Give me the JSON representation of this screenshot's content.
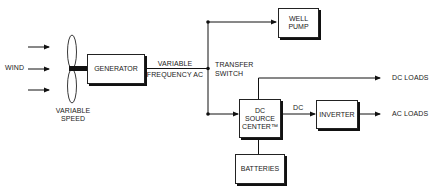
{
  "diagram": {
    "type": "block-diagram",
    "inputs": {
      "wind_label": "WIND",
      "rotor_label_line1": "VARIABLE",
      "rotor_label_line2": "SPEED"
    },
    "blocks": {
      "generator": "GENERATOR",
      "well_pump_line1": "WELL",
      "well_pump_line2": "PUMP",
      "dc_source_line1": "DC",
      "dc_source_line2": "SOURCE",
      "dc_source_line3": "CENTER™",
      "inverter": "INVERTER",
      "batteries": "BATTERIES"
    },
    "connections": {
      "gen_out_line1": "VARIABLE",
      "gen_out_line2": "FREQUENCY AC",
      "switch_line1": "TRANSFER",
      "switch_line2": "SWITCH",
      "dc_link": "DC"
    },
    "outputs": {
      "dc_loads": "DC LOADS",
      "ac_loads": "AC LOADS"
    },
    "edges": [
      {
        "from": "wind",
        "to": "rotor"
      },
      {
        "from": "rotor",
        "to": "generator"
      },
      {
        "from": "generator",
        "to": "transfer_switch",
        "label": "VARIABLE FREQUENCY AC"
      },
      {
        "from": "transfer_switch",
        "to": "well_pump"
      },
      {
        "from": "transfer_switch",
        "to": "dc_source_center"
      },
      {
        "from": "dc_source_center",
        "to": "dc_loads"
      },
      {
        "from": "dc_source_center",
        "to": "inverter",
        "label": "DC"
      },
      {
        "from": "inverter",
        "to": "ac_loads"
      },
      {
        "from": "batteries",
        "to": "dc_source_center"
      }
    ]
  }
}
